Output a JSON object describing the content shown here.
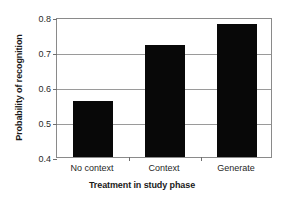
{
  "chart_data": {
    "type": "bar",
    "title": "",
    "categories": [
      "No context",
      "Context",
      "Generate"
    ],
    "values": [
      0.56,
      0.72,
      0.78
    ],
    "series": [
      {
        "name": "Probability of recognition",
        "values": [
          0.56,
          0.72,
          0.78
        ]
      }
    ],
    "xlabel": "Treatment in study phase",
    "ylabel": "Probability of recognition",
    "ylim": [
      0.4,
      0.8
    ],
    "yticks": [
      "0.4",
      "0.5",
      "0.6",
      "0.7",
      "0.8"
    ],
    "ytick_values": [
      0.4,
      0.5,
      0.6,
      0.7,
      0.8
    ],
    "grid": true,
    "legend": false,
    "legend_position": "none",
    "bar_color": "#080808",
    "grid_color": "#9a9a9a",
    "axis_color": "#8a8a8a",
    "background": "#ffffff"
  }
}
